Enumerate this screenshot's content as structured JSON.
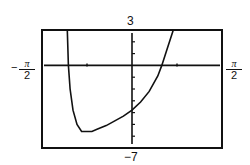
{
  "chart_data": {
    "type": "line",
    "title": "",
    "xlabel": "",
    "ylabel": "",
    "xlim": [
      "-π/2",
      "π/2"
    ],
    "xlim_numeric": [
      -1.5708,
      1.5708
    ],
    "ylim": [
      -7,
      3
    ],
    "x_tick_spacing": "π/4",
    "y_tick_spacing": 1,
    "grid": false,
    "labels": {
      "ymax": "3",
      "ymin": "−7",
      "xmin_sign": "−",
      "xmin_num": "π",
      "xmin_den": "2",
      "xmax_num": "π",
      "xmax_den": "2"
    },
    "series": [
      {
        "name": "f(x)",
        "x": [
          -1.13,
          -1.11,
          -1.08,
          -1.03,
          -0.96,
          -0.88,
          -0.79,
          -0.7,
          -0.6,
          -0.45,
          -0.3,
          -0.15,
          0,
          0.15,
          0.3,
          0.45,
          0.52,
          0.6,
          0.72
        ],
        "y": [
          3,
          0,
          -2,
          -3.8,
          -5,
          -5.6,
          -5.6,
          -5.6,
          -5.4,
          -5.1,
          -4.7,
          -4.3,
          -3.8,
          -3.1,
          -2.2,
          -0.9,
          0,
          1.2,
          3
        ]
      }
    ]
  }
}
